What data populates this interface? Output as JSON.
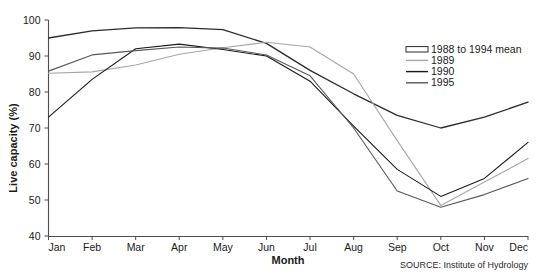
{
  "chart_data": {
    "type": "line",
    "title": "",
    "xlabel": "Month",
    "ylabel": "Live capacity (%)",
    "categories": [
      "Jan",
      "Feb",
      "Mar",
      "Apr",
      "May",
      "Jun",
      "Jul",
      "Aug",
      "Sep",
      "Oct",
      "Nov",
      "Dec"
    ],
    "ylim": [
      40,
      100
    ],
    "yticks": [
      40,
      50,
      60,
      70,
      80,
      90,
      100
    ],
    "xlim_labels": [
      "Jan",
      "Dec"
    ],
    "grid": false,
    "legend_position": "top-right",
    "source": "SOURCE: Institute of Hydrology",
    "series": [
      {
        "name": "1988 to 1994 mean",
        "color": "#2b2b2b",
        "style": "outline",
        "values": [
          95.0,
          97.0,
          97.8,
          97.9,
          97.3,
          93.5,
          86.0,
          79.5,
          73.5,
          70.0,
          73.0,
          77.2
        ]
      },
      {
        "name": "1989",
        "color": "#a6a6a6",
        "style": "solid",
        "values": [
          85.2,
          85.6,
          87.5,
          90.5,
          92.3,
          93.8,
          92.5,
          85.0,
          66.5,
          48.5,
          55.0,
          61.5
        ]
      },
      {
        "name": "1990",
        "color": "#1a1a1a",
        "style": "solid",
        "values": [
          73.0,
          83.5,
          92.0,
          93.3,
          91.8,
          90.0,
          83.0,
          70.5,
          58.5,
          51.0,
          56.0,
          66.0
        ]
      },
      {
        "name": "1995",
        "color": "#595959",
        "style": "solid",
        "values": [
          85.8,
          90.3,
          91.5,
          92.5,
          92.2,
          90.3,
          84.5,
          70.0,
          52.5,
          48.0,
          51.5,
          56.0
        ]
      }
    ]
  },
  "legend": {
    "items": [
      {
        "label": "1988 to 1994 mean"
      },
      {
        "label": "1989"
      },
      {
        "label": "1990"
      },
      {
        "label": "1995"
      }
    ]
  },
  "axes": {
    "y_title": "Live capacity (%)",
    "x_title": "Month",
    "y_ticks": [
      "100",
      "90",
      "80",
      "70",
      "60",
      "50",
      "40"
    ],
    "x_ticks": [
      "Jan",
      "Feb",
      "Mar",
      "Apr",
      "May",
      "Jun",
      "Jul",
      "Aug",
      "Sep",
      "Oct",
      "Nov",
      "Dec"
    ]
  },
  "footer": {
    "source": "SOURCE: Institute of Hydrology"
  }
}
